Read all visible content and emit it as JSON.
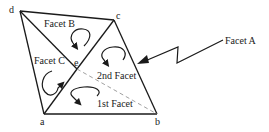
{
  "diagram": {
    "type": "facet-mesh",
    "vertices": [
      {
        "id": "d",
        "label": "d",
        "x": 20,
        "y": 11
      },
      {
        "id": "c",
        "label": "c",
        "x": 114,
        "y": 20
      },
      {
        "id": "a",
        "label": "a",
        "x": 44,
        "y": 114
      },
      {
        "id": "b",
        "label": "b",
        "x": 157,
        "y": 114
      },
      {
        "id": "e",
        "label": "e",
        "x": 77,
        "y": 69
      }
    ],
    "edges": [
      {
        "from": "d",
        "to": "c",
        "style": "solid"
      },
      {
        "from": "d",
        "to": "a",
        "style": "solid"
      },
      {
        "from": "d",
        "to": "e",
        "style": "solid"
      },
      {
        "from": "c",
        "to": "e",
        "style": "solid"
      },
      {
        "from": "e",
        "to": "a",
        "style": "solid"
      },
      {
        "from": "c",
        "to": "b",
        "style": "solid"
      },
      {
        "from": "a",
        "to": "b",
        "style": "solid"
      },
      {
        "from": "e",
        "to": "b",
        "style": "dashed"
      }
    ],
    "facet_labels": {
      "facet_b": "Facet B",
      "facet_c": "Facet C",
      "second_facet": "2nd Facet",
      "first_facet": "1st Facet",
      "facet_a": "Facet A"
    },
    "rotation_arrows": [
      {
        "facet": "Facet B",
        "direction": "clockwise"
      },
      {
        "facet": "2nd Facet",
        "direction": "clockwise"
      },
      {
        "facet": "Facet C",
        "direction": "clockwise"
      },
      {
        "facet": "1st Facet",
        "direction": "clockwise"
      }
    ],
    "pointer": {
      "label": "Facet A",
      "target": "edge c-b"
    }
  }
}
